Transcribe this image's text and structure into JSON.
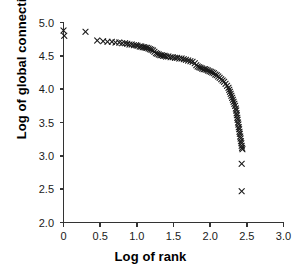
{
  "chart_data": {
    "type": "scatter",
    "title": "",
    "xlabel": "Log of rank",
    "ylabel": "Log of global connectivity",
    "xlim": [
      0.0,
      3.0
    ],
    "ylim": [
      2.0,
      5.0
    ],
    "xticks": [
      "0",
      "0.5",
      "1.0",
      "1.5",
      "2.0",
      "2.5",
      "3.0"
    ],
    "xtick_values": [
      0.0,
      0.5,
      1.0,
      1.5,
      2.0,
      2.5,
      3.0
    ],
    "yticks": [
      "2.0",
      "2.5",
      "3.0",
      "3.5",
      "4.0",
      "4.5",
      "5.0"
    ],
    "ytick_values": [
      2.0,
      2.5,
      3.0,
      3.5,
      4.0,
      4.5,
      5.0
    ],
    "grid": false,
    "legend": false,
    "marker": "x",
    "marker_color": "#1a1a1a",
    "axis_color": "#333333",
    "background": "#ffffff",
    "series": [
      {
        "name": "global connectivity vs rank",
        "points": [
          [
            0.0,
            4.88
          ],
          [
            0.01,
            4.8
          ],
          [
            0.3,
            4.86
          ],
          [
            0.46,
            4.73
          ],
          [
            0.54,
            4.72
          ],
          [
            0.6,
            4.71
          ],
          [
            0.66,
            4.71
          ],
          [
            0.71,
            4.7
          ],
          [
            0.76,
            4.7
          ],
          [
            0.8,
            4.69
          ],
          [
            0.84,
            4.69
          ],
          [
            0.87,
            4.68
          ],
          [
            0.9,
            4.67
          ],
          [
            0.93,
            4.67
          ],
          [
            0.96,
            4.66
          ],
          [
            0.99,
            4.66
          ],
          [
            1.01,
            4.65
          ],
          [
            1.04,
            4.64
          ],
          [
            1.06,
            4.64
          ],
          [
            1.08,
            4.63
          ],
          [
            1.1,
            4.63
          ],
          [
            1.12,
            4.62
          ],
          [
            1.14,
            4.62
          ],
          [
            1.16,
            4.61
          ],
          [
            1.18,
            4.6
          ],
          [
            1.2,
            4.59
          ],
          [
            1.22,
            4.58
          ],
          [
            1.24,
            4.56
          ],
          [
            1.26,
            4.54
          ],
          [
            1.28,
            4.53
          ],
          [
            1.3,
            4.52
          ],
          [
            1.32,
            4.51
          ],
          [
            1.34,
            4.51
          ],
          [
            1.36,
            4.5
          ],
          [
            1.38,
            4.5
          ],
          [
            1.4,
            4.49
          ],
          [
            1.43,
            4.49
          ],
          [
            1.46,
            4.48
          ],
          [
            1.49,
            4.48
          ],
          [
            1.52,
            4.47
          ],
          [
            1.55,
            4.47
          ],
          [
            1.58,
            4.46
          ],
          [
            1.61,
            4.46
          ],
          [
            1.64,
            4.45
          ],
          [
            1.67,
            4.44
          ],
          [
            1.7,
            4.43
          ],
          [
            1.73,
            4.42
          ],
          [
            1.76,
            4.41
          ],
          [
            1.79,
            4.39
          ],
          [
            1.81,
            4.36
          ],
          [
            1.83,
            4.34
          ],
          [
            1.85,
            4.33
          ],
          [
            1.87,
            4.32
          ],
          [
            1.89,
            4.31
          ],
          [
            1.91,
            4.3
          ],
          [
            1.93,
            4.3
          ],
          [
            1.95,
            4.29
          ],
          [
            1.97,
            4.28
          ],
          [
            1.99,
            4.27
          ],
          [
            2.01,
            4.26
          ],
          [
            2.03,
            4.25
          ],
          [
            2.05,
            4.24
          ],
          [
            2.07,
            4.22
          ],
          [
            2.09,
            4.21
          ],
          [
            2.11,
            4.19
          ],
          [
            2.13,
            4.17
          ],
          [
            2.15,
            4.15
          ],
          [
            2.17,
            4.13
          ],
          [
            2.19,
            4.11
          ],
          [
            2.21,
            4.08
          ],
          [
            2.23,
            4.05
          ],
          [
            2.25,
            4.02
          ],
          [
            2.26,
            3.99
          ],
          [
            2.27,
            3.96
          ],
          [
            2.28,
            3.93
          ],
          [
            2.29,
            3.9
          ],
          [
            2.3,
            3.87
          ],
          [
            2.31,
            3.84
          ],
          [
            2.32,
            3.81
          ],
          [
            2.33,
            3.78
          ],
          [
            2.34,
            3.75
          ],
          [
            2.35,
            3.71
          ],
          [
            2.355,
            3.68
          ],
          [
            2.36,
            3.64
          ],
          [
            2.365,
            3.61
          ],
          [
            2.37,
            3.57
          ],
          [
            2.375,
            3.54
          ],
          [
            2.38,
            3.5
          ],
          [
            2.385,
            3.47
          ],
          [
            2.39,
            3.43
          ],
          [
            2.395,
            3.4
          ],
          [
            2.4,
            3.36
          ],
          [
            2.405,
            3.33
          ],
          [
            2.41,
            3.29
          ],
          [
            2.415,
            3.26
          ],
          [
            2.42,
            3.22
          ],
          [
            2.425,
            3.19
          ],
          [
            2.43,
            3.15
          ],
          [
            2.435,
            3.12
          ],
          [
            2.44,
            3.1
          ],
          [
            2.43,
            2.88
          ],
          [
            2.43,
            2.47
          ]
        ]
      }
    ],
    "annotations": [
      {
        "text": "two isolated low outliers near log-rank 2.43",
        "values": [
          2.88,
          2.47
        ]
      }
    ]
  },
  "axes": {
    "x_title": "Log of rank",
    "y_title": "Log of global connectivity"
  }
}
